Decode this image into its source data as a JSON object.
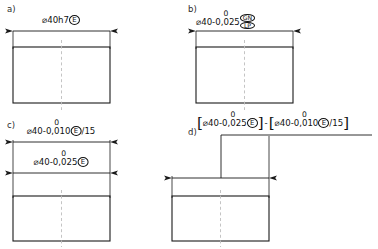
{
  "figure": {
    "type": "engineering-drawing",
    "line_color": "#1a1a1a",
    "centerline_color": "#b9b9b9",
    "background": "#ffffff"
  },
  "panels": [
    {
      "id": "a",
      "label": "a)",
      "label_x": 8,
      "label_y": 6,
      "rect": {
        "x": 13,
        "y": 47,
        "w": 97,
        "h": 56
      },
      "dimension_line": {
        "x1": 13,
        "x2": 110,
        "y": 31
      },
      "extension_top": 31,
      "annotation": {
        "x": 61.5,
        "y": 14,
        "prefix": "⌀40h7",
        "basic": "⌀40h7",
        "nominal": "",
        "upper_dev": "",
        "lower_dev": "",
        "modifiers": [
          "E"
        ],
        "suffix": ""
      }
    },
    {
      "id": "b",
      "label": "b)",
      "label_x": 189,
      "label_y": 6,
      "rect": {
        "x": 196,
        "y": 47,
        "w": 97,
        "h": 56
      },
      "dimension_line": {
        "x1": 196,
        "x2": 293,
        "y": 31
      },
      "extension_top": 31,
      "annotation": {
        "x": 240,
        "y": 14,
        "prefix": "⌀40-",
        "nominal": "⌀40",
        "upper_dev": "0",
        "lower_dev": "0,025",
        "modifiers": [
          "GN",
          "LP"
        ],
        "suffix": ""
      }
    },
    {
      "id": "c",
      "label": "c)",
      "label_x": 8,
      "label_y": 122,
      "rect": {
        "x": 13,
        "y": 196,
        "w": 97,
        "h": 45
      },
      "dimension_lines": [
        {
          "x1": 13,
          "x2": 110,
          "y": 142
        },
        {
          "x1": 13,
          "x2": 110,
          "y": 173
        }
      ],
      "annotations": [
        {
          "x": 61.5,
          "y": 125,
          "nominal": "⌀40",
          "upper_dev": "0",
          "lower_dev": "0,010",
          "modifiers": [
            "E"
          ],
          "suffix": "/15"
        },
        {
          "x": 61.5,
          "y": 156,
          "nominal": "⌀40",
          "upper_dev": "0",
          "lower_dev": "0,025",
          "modifiers": [
            "E"
          ],
          "suffix": ""
        }
      ]
    },
    {
      "id": "d",
      "label": "d)",
      "label_x": 189,
      "label_y": 128,
      "rect": {
        "x": 172,
        "y": 196,
        "w": 97,
        "h": 45
      },
      "dimension_line": {
        "x1": 172,
        "x2": 269,
        "y": 178
      },
      "leader": {
        "x": 221,
        "y_top": 135,
        "y_bottom": 178
      },
      "leader_shelf": {
        "x1": 221,
        "x2": 370,
        "y": 135
      },
      "annotation": {
        "x": 197,
        "y": 118,
        "group1": {
          "nominal": "⌀40",
          "upper_dev": "0",
          "lower_dev": "0,025",
          "modifiers": [
            "E"
          ],
          "suffix": ""
        },
        "separator": "-",
        "group2": {
          "nominal": "⌀40",
          "upper_dev": "0",
          "lower_dev": "0,010",
          "modifiers": [
            "E"
          ],
          "suffix": "/15"
        }
      }
    }
  ],
  "symbols": {
    "diameter": "⌀",
    "envelope": "E",
    "general_size": "GN",
    "two_point_size": "LP",
    "bracket_open": "[",
    "bracket_close": "]",
    "separator": "-"
  }
}
